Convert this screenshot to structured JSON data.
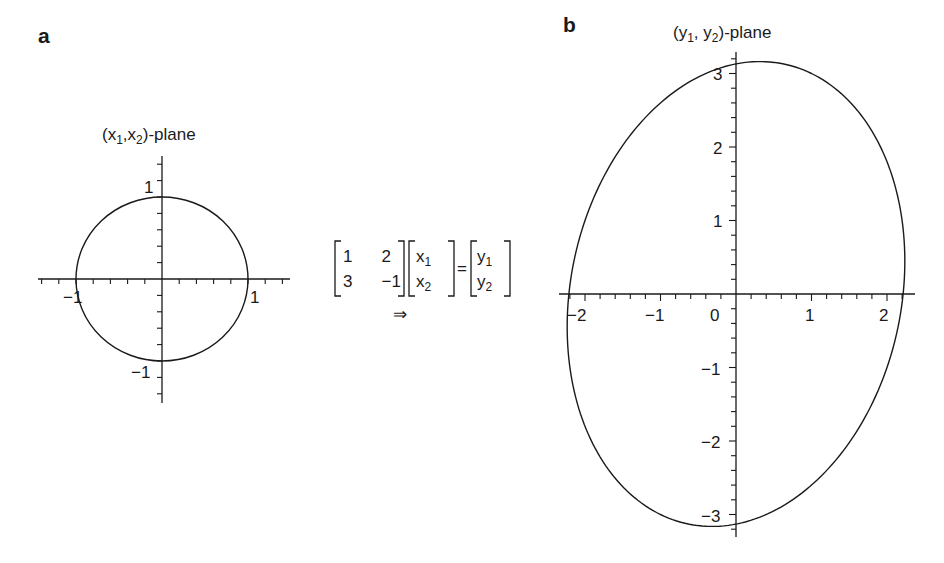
{
  "panel_a": {
    "letter": "a",
    "plane_label": {
      "open": "(x",
      "sub1": "1",
      "mid": ",x",
      "sub2": "2",
      "close": ")-plane"
    },
    "x_tick_labels": {
      "neg": "−1",
      "pos": "1"
    },
    "y_tick_labels": {
      "pos": "1",
      "neg": "−1"
    }
  },
  "panel_b": {
    "letter": "b",
    "plane_label": {
      "open": "(y",
      "sub1": "1",
      "mid": ", y",
      "sub2": "2",
      "close": ")-plane"
    },
    "x_tick_labels": [
      "−2",
      "−1",
      "0",
      "1",
      "2"
    ],
    "y_tick_labels": [
      "3",
      "2",
      "1",
      "−1",
      "−2",
      "−3"
    ]
  },
  "equation": {
    "matrix": [
      [
        "1",
        "2"
      ],
      [
        "3",
        "−1"
      ]
    ],
    "x_vector": [
      {
        "base": "x",
        "sub": "1"
      },
      {
        "base": "x",
        "sub": "2"
      }
    ],
    "equals": "=",
    "y_vector": [
      {
        "base": "y",
        "sub": "1"
      },
      {
        "base": "y",
        "sub": "2"
      }
    ],
    "implies": "⇒"
  },
  "chart_data": [
    {
      "type": "line",
      "title": "(x1,x2)-plane",
      "panel": "a",
      "description": "Unit circle x1^2 + x2^2 = 1",
      "xlabel": "x1",
      "ylabel": "x2",
      "xlim": [
        -1.45,
        1.5
      ],
      "ylim": [
        -1.5,
        1.5
      ],
      "x_ticks_major": [
        -1,
        1
      ],
      "minor_tick_step": 0.2,
      "grid": false,
      "series": [
        {
          "name": "unit circle",
          "parametric": "x1=cos t, x2=sin t",
          "points": [
            [
              1,
              0
            ],
            [
              0,
              1
            ],
            [
              -1,
              0
            ],
            [
              0,
              -1
            ]
          ]
        }
      ]
    },
    {
      "type": "line",
      "title": "(y1, y2)-plane",
      "panel": "b",
      "description": "Image of unit circle under A=[[1,2],[3,-1]]: ellipse",
      "xlabel": "y1",
      "ylabel": "y2",
      "xlim": [
        -2.3,
        2.35
      ],
      "ylim": [
        -3.3,
        3.3
      ],
      "x_ticks_major": [
        -2,
        -1,
        0,
        1,
        2
      ],
      "y_ticks_major": [
        -3,
        -2,
        -1,
        1,
        2,
        3
      ],
      "minor_tick_step": 0.2,
      "grid": false,
      "series": [
        {
          "name": "ellipse",
          "parametric": "y1 = cos t + 2 sin t, y2 = 3 cos t - sin t",
          "points": [
            [
              1,
              3
            ],
            [
              2,
              -1
            ],
            [
              -1,
              -3
            ],
            [
              -2,
              1
            ],
            [
              1.6,
              0
            ],
            [
              -1.6,
              0
            ],
            [
              0,
              2.24
            ],
            [
              0,
              -2.24
            ],
            [
              1.41,
              3.16
            ],
            [
              -1.41,
              -3.16
            ]
          ]
        }
      ]
    }
  ],
  "matrix_A": [
    [
      1,
      2
    ],
    [
      3,
      -1
    ]
  ]
}
